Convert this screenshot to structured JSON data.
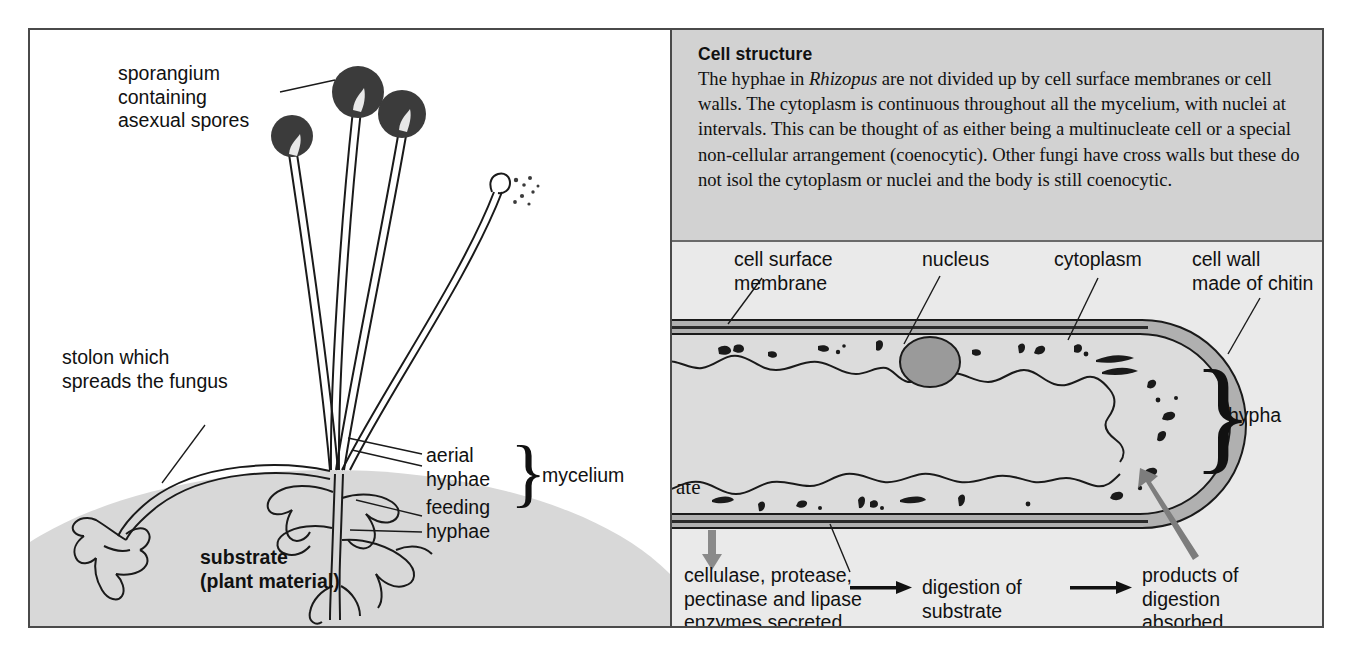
{
  "figure": {
    "left_panel": {
      "labels": {
        "sporangium": "sporangium\ncontaining\nasexual spores",
        "stolon": "stolon which\nspreads the fungus",
        "aerial_hyphae": "aerial\nhyphae",
        "feeding_hyphae": "feeding\nhyphae",
        "mycelium": "mycelium",
        "substrate": "substrate\n(plant material)",
        "brace_glyph": "}"
      }
    },
    "right_panel": {
      "textbox": {
        "title": "Cell structure",
        "body_before_italic": "The hyphae in ",
        "italic_term": "Rhizopus",
        "body_after_italic": " are not divided up by cell surface membranes or cell walls. The cytoplasm is continuous throughout all the mycelium, with nuclei at intervals. This can be thought of as either being a multinucleate cell or a special non-cellular arrangement (coenocytic). Other fungi have cross walls but these do not isol the cytoplasm or nuclei and the body is still coenocytic."
      },
      "labels": {
        "cell_surface_membrane": "cell surface\nmembrane",
        "nucleus": "nucleus",
        "cytoplasm": "cytoplasm",
        "cell_wall": "cell wall\nmade of chitin",
        "hypha": "hypha",
        "substrate_clipped": "ate",
        "brace_glyph": "}"
      },
      "flow": {
        "step1": "cellulase, protease,\npectinase and lipase\nenzymes secreted",
        "step2": "digestion of\nsubstrate",
        "step3": "products of\ndigestion\nabsorbed"
      }
    },
    "colors": {
      "border": "#4a4a4a",
      "textbox_bg": "#d2d2d2",
      "lower_panel_bg": "#eaeaea",
      "substrate_gray": "#d8d8d8",
      "cell_wall_gray": "#b0b0b0",
      "cytoplasm_gray": "#dcdcdc",
      "nucleus_gray": "#9a9a9a",
      "sporangium_dark": "#3b3b3b",
      "arrow_gray": "#8a8a8a",
      "ink": "#1a1a1a"
    }
  }
}
